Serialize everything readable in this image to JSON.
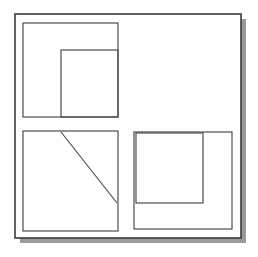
{
  "figure": {
    "kind": "geometric-line-drawing",
    "canvas": {
      "width": 258,
      "height": 257,
      "background": "#ffffff"
    },
    "colors": {
      "stroke": "#4d4d4d",
      "frame_stroke": "#3a3a3a",
      "shadow": "#9a9a9a",
      "fill": "#ffffff"
    },
    "stroke_widths": {
      "frame": 1.6,
      "shape": 1.2,
      "diagonal": 1.2
    },
    "frame": {
      "name": "outer-frame",
      "x": 15,
      "y": 14,
      "width": 226,
      "height": 224,
      "shadow_offset_x": 5,
      "shadow_offset_y": 5
    },
    "shapes": [
      {
        "name": "top-left-outer-rect",
        "type": "rect",
        "x": 23,
        "y": 23,
        "width": 95,
        "height": 94
      },
      {
        "name": "top-left-inner-rect",
        "type": "rect",
        "x": 61,
        "y": 50,
        "width": 57,
        "height": 67
      },
      {
        "name": "bottom-left-outer-rect",
        "type": "rect",
        "x": 23,
        "y": 131,
        "width": 95,
        "height": 100
      },
      {
        "name": "bottom-left-diagonal",
        "type": "line",
        "x1": 61,
        "y1": 132,
        "x2": 117,
        "y2": 203
      },
      {
        "name": "bottom-right-outer-rect",
        "type": "rect",
        "x": 134,
        "y": 132,
        "width": 98,
        "height": 97
      },
      {
        "name": "bottom-right-inner-rect",
        "type": "rect",
        "x": 136,
        "y": 133,
        "width": 67,
        "height": 70
      }
    ]
  }
}
